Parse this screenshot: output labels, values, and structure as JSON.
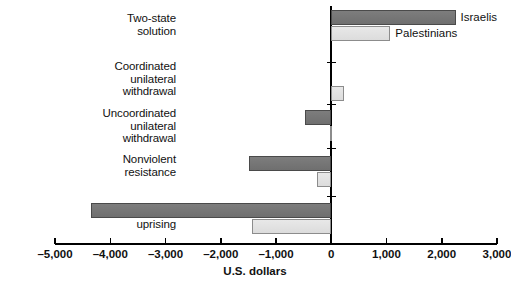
{
  "chart_data": {
    "type": "bar",
    "orientation": "horizontal",
    "title": "",
    "subtitle": "",
    "xlabel": "U.S. dollars",
    "ylabel": "",
    "xlim": [
      -5000,
      3000
    ],
    "xticks": [
      -5000,
      -4000,
      -3000,
      -2000,
      -1000,
      0,
      1000,
      2000,
      3000
    ],
    "xticklabels": [
      "–5,000",
      "–4,000",
      "–3,000",
      "–2,000",
      "–1,000",
      "0",
      "1,000",
      "2,000",
      "3,000"
    ],
    "grid": false,
    "legend_position": "inline-at-bar-ends",
    "categories": [
      "Two-state\nsolution",
      "Coordinated\nunilateral\nwithdrawal",
      "Uncoordinated\nunilateral\nwithdrawal",
      "Nonviolent\nresistance",
      "Violent\nuprising"
    ],
    "series": [
      {
        "name": "Israelis",
        "color": "#757575",
        "values": [
          2250,
          0,
          -480,
          -1480,
          -4340
        ]
      },
      {
        "name": "Palestinians",
        "color": "#e2e2e2",
        "values": [
          1070,
          230,
          -30,
          -250,
          -1430
        ]
      }
    ]
  },
  "annotations": {
    "israelis_label": "Israelis",
    "palestinians_label": "Palestinians"
  }
}
